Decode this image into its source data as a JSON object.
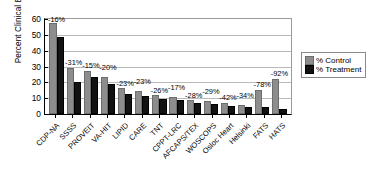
{
  "chart_data": {
    "type": "bar",
    "title": "",
    "xlabel": "",
    "ylabel": "Percent Clinical Events",
    "ylim": [
      0,
      60
    ],
    "yticks": [
      60,
      50,
      40,
      30,
      20,
      10,
      0
    ],
    "grid": true,
    "legend_position": "right",
    "categories": [
      "CDP-NA",
      "SSSS",
      "PROVEIT",
      "VA-HIT",
      "LIPID",
      "CARE",
      "TNT",
      "CPPT-LRC",
      "AFCAPS/TEX",
      "WOSCOPS",
      "Osloc Heart",
      "Helsinki",
      "FATS",
      "HATS"
    ],
    "series": [
      {
        "name": "% Control",
        "color": "#8d8d8d",
        "values": [
          56,
          28,
          26,
          22,
          15,
          13,
          10.5,
          9.5,
          7.5,
          7,
          6,
          4.5,
          14,
          21
        ]
      },
      {
        "name": "% Treatment",
        "color": "#121212",
        "values": [
          47.5,
          19,
          22,
          17.5,
          11.5,
          10,
          8,
          7.8,
          5.4,
          5,
          3.5,
          3,
          3,
          2
        ]
      }
    ],
    "annotations": [
      "-16%",
      "-31%",
      "-15%",
      "-20%",
      "-23%",
      "-23%",
      "-26%",
      "-17%",
      "-28%",
      "-29%",
      "-42%",
      "-34%",
      "-78%",
      "-92%"
    ]
  },
  "legend": {
    "items": [
      {
        "label": "% Control",
        "key": "control"
      },
      {
        "label": "% Treatment",
        "key": "treatment"
      }
    ]
  }
}
